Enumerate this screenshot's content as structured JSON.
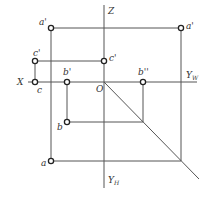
{
  "diagram": {
    "type": "orthographic-projection",
    "colors": {
      "line": "#555555",
      "point": "#222222",
      "text": "#333333",
      "background": "#ffffff"
    },
    "axes": {
      "x_label": "X",
      "z_label": "Z",
      "origin_label": "O",
      "yw_label": "Y",
      "yw_sub": "W",
      "yh_label": "Y",
      "yh_sub": "H"
    },
    "points": {
      "a_prime_v": "a'",
      "a_prime_w": "a'",
      "c_prime_v": "c'",
      "c_prime_w": "c'",
      "c": "c",
      "b_prime": "b'",
      "b_double_prime": "b''",
      "b": "b",
      "a": "a"
    }
  }
}
